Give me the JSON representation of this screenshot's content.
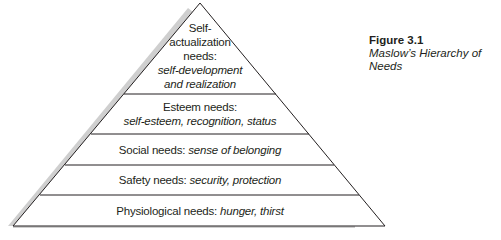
{
  "figure": {
    "number": "Figure 3.1",
    "title": "Maslow’s Hierarchy of Needs"
  },
  "pyramid": {
    "levels": [
      {
        "name_lines": [
          "Self-",
          "actualization",
          "needs:"
        ],
        "examples_lines": [
          "self-development",
          "and realization"
        ]
      },
      {
        "name": "Esteem needs:",
        "examples": "self-esteem, recognition, status"
      },
      {
        "name": "Social needs:",
        "examples": "sense of belonging"
      },
      {
        "name": "Safety needs:",
        "examples": "security, protection"
      },
      {
        "name": "Physiological needs:",
        "examples": "hunger, thirst"
      }
    ],
    "colors": {
      "outline": "#231f20",
      "shadow": "#c8c8c8"
    }
  }
}
